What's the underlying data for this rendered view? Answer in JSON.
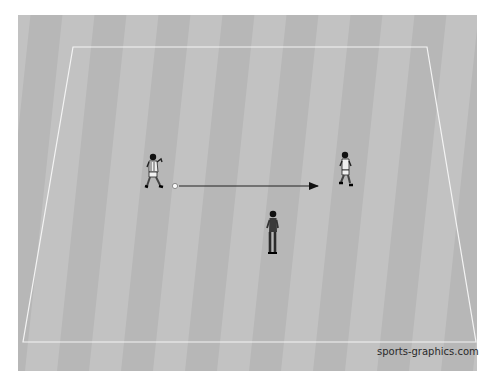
{
  "diagram": {
    "type": "soccer-drill",
    "field": {
      "background_color": "#bdbdbd",
      "stripe_light": "#c4c4c4",
      "stripe_dark": "#b3b3b3",
      "line_color": "#f2f2f2",
      "stripe_count": 14
    },
    "elements": [
      {
        "id": "player-passer",
        "kind": "player",
        "role": "passer",
        "x": 153,
        "y": 172
      },
      {
        "id": "ball",
        "kind": "ball",
        "x": 175,
        "y": 186
      },
      {
        "id": "pass-arrow",
        "kind": "arrow",
        "from": [
          179,
          186
        ],
        "to": [
          318,
          186
        ]
      },
      {
        "id": "player-receiver",
        "kind": "player",
        "role": "receiver",
        "x": 345,
        "y": 168
      },
      {
        "id": "coach",
        "kind": "coach",
        "x": 273,
        "y": 232
      }
    ]
  },
  "watermark": {
    "text": "sports-graphics.com"
  }
}
